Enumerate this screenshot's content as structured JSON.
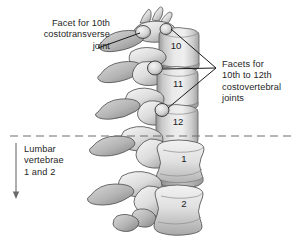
{
  "figure": {
    "background_color": "#ffffff",
    "text_color": "#262626",
    "line_color": "#1a1a1a"
  },
  "labels": {
    "costotransverse": "Facet for 10th\ncostotransverse\njoint",
    "costovertebral": "Facets for\n10th to 12th\ncostovertebral\njoints",
    "lumbar": "Lumbar\nvertebrae\n1 and 2"
  },
  "vertebrae": [
    {
      "number": "10",
      "region": "thoracic"
    },
    {
      "number": "11",
      "region": "thoracic"
    },
    {
      "number": "12",
      "region": "thoracic"
    },
    {
      "number": "1",
      "region": "lumbar"
    },
    {
      "number": "2",
      "region": "lumbar"
    }
  ],
  "annotations": {
    "divider": "dashed-thoracolumbar-boundary",
    "lumbar_arrow": "down-arrow",
    "leader_costotransverse": "leader-line-to-superior-facet",
    "leader_costovertebral": "three-branch-leader-lines"
  }
}
